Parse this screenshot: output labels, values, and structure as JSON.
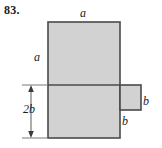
{
  "figure": {
    "problem_number": "83.",
    "shape_description": "L-shaped polygon formed by a tall rectangle with a small rectangle attached at its lower right",
    "fill_color": "#d2d2d2",
    "stroke_color": "#4a4a4a",
    "background_color": "#ffffff",
    "labels": {
      "a_top": "a",
      "a_left": "a",
      "b_right": "b",
      "b_bottom": "b",
      "two_b_left": "2b"
    },
    "dimension": {
      "name": "2b",
      "orientation": "vertical",
      "arrow_style": "double-headed"
    }
  }
}
